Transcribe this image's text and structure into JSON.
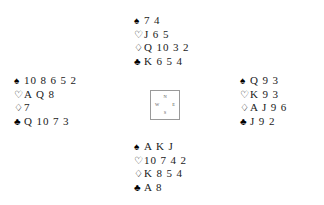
{
  "diagram": {
    "kind": "bridge-deal",
    "suit_symbols": {
      "spade": "♠",
      "heart": "♡",
      "diamond": "♢",
      "club": "♣"
    },
    "compass": {
      "north": "N",
      "west": "W",
      "east": "E",
      "south": "S"
    },
    "hands": {
      "north": {
        "label": "North",
        "spades": "7 4",
        "hearts": "J 6 5",
        "diamonds": "Q 10 3 2",
        "clubs": "K 6 5 4"
      },
      "west": {
        "label": "West",
        "spades": "10 8 6 5 2",
        "hearts": "A Q 8",
        "diamonds": "7",
        "clubs": "Q 10 7 3"
      },
      "east": {
        "label": "East",
        "spades": "Q 9 3",
        "hearts": "K 9 3",
        "diamonds": "A J 9 6",
        "clubs": "J 9 2"
      },
      "south": {
        "label": "South",
        "spades": "A K J",
        "hearts": "10 7 4 2",
        "diamonds": "K 8 5 4",
        "clubs": "A 8"
      }
    }
  }
}
